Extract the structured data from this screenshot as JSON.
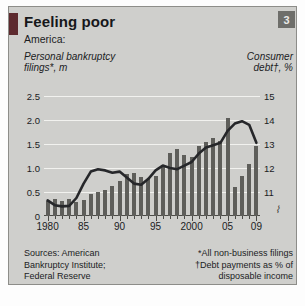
{
  "panel": {
    "title": "Feeling poor",
    "badge": "3",
    "subtitle": "America:",
    "accent_color": "#5d2a2e",
    "bar_color": "#5e5e5a",
    "line_color": "#26272a",
    "panel_color": "#cfcfcc"
  },
  "axis_titles": {
    "left_line1": "Personal bankruptcy",
    "left_line2": "filings*, m",
    "right_line1": "Consumer",
    "right_line2": "debt†, %"
  },
  "footnotes": {
    "sources_line1": "Sources: American",
    "sources_line2": "Bankruptcy Institute;",
    "sources_line3": "Federal Reserve",
    "note_line1": "*All non-business filings",
    "note_line2": "†Debt payments as % of",
    "note_line3": "disposable income",
    "axis_break_symbol": "⌇"
  },
  "chart_data": {
    "type": "bar",
    "title": "Feeling poor",
    "subtitle": "America:",
    "xlabel": "",
    "ylabel": "Personal bankruptcy filings*, m",
    "y2label": "Consumer debt†, %",
    "ylim": [
      0,
      2.5
    ],
    "y2lim": [
      10,
      15
    ],
    "grid": true,
    "legend": "none",
    "left_ticks": [
      "0",
      "0.5",
      "1.0",
      "1.5",
      "2.0",
      "2.5"
    ],
    "left_tick_values": [
      0,
      0.5,
      1.0,
      1.5,
      2.0,
      2.5
    ],
    "right_ticks": [
      "11",
      "12",
      "13",
      "14",
      "15"
    ],
    "right_tick_values": [
      11,
      12,
      13,
      14,
      15
    ],
    "x_tick_labels": [
      "1980",
      "85",
      "90",
      "95",
      "2000",
      "05",
      "09"
    ],
    "x_tick_years": [
      1980,
      1985,
      1990,
      1995,
      2000,
      2005,
      2009
    ],
    "xlim": [
      1980,
      2009
    ],
    "x": [
      1980,
      1981,
      1982,
      1983,
      1984,
      1985,
      1986,
      1987,
      1988,
      1989,
      1990,
      1991,
      1992,
      1993,
      1994,
      1995,
      1996,
      1997,
      1998,
      1999,
      2000,
      2001,
      2002,
      2003,
      2004,
      2005,
      2006,
      2007,
      2008,
      2009
    ],
    "series": [
      {
        "name": "Personal bankruptcy filings*, m",
        "type": "bar",
        "axis": "left",
        "values": [
          0.31,
          0.36,
          0.31,
          0.35,
          0.29,
          0.34,
          0.45,
          0.5,
          0.55,
          0.62,
          0.72,
          0.87,
          0.9,
          0.81,
          0.78,
          0.83,
          1.04,
          1.32,
          1.4,
          1.28,
          1.22,
          1.45,
          1.54,
          1.62,
          1.56,
          2.04,
          0.6,
          0.83,
          1.08,
          1.45
        ]
      },
      {
        "name": "Consumer debt†, %",
        "type": "line",
        "axis": "right",
        "values": [
          10.65,
          10.45,
          10.4,
          10.42,
          10.75,
          11.35,
          11.85,
          11.95,
          11.9,
          11.8,
          11.85,
          11.6,
          11.35,
          11.3,
          11.55,
          11.9,
          12.1,
          12.0,
          11.95,
          12.1,
          12.25,
          12.6,
          12.85,
          12.95,
          13.05,
          13.55,
          13.85,
          13.95,
          13.8,
          13.05
        ]
      }
    ]
  }
}
